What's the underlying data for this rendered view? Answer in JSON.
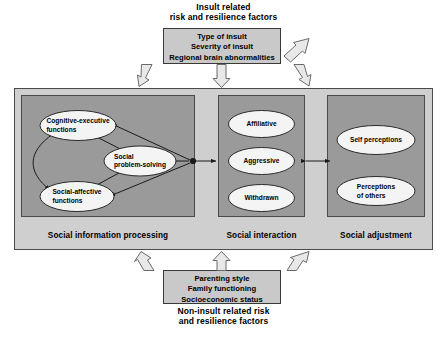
{
  "figure": {
    "top_caption": [
      "Insult related",
      "risk and resilience factors"
    ],
    "bottom_caption": [
      "Non-insult related risk",
      "and resilience factors"
    ]
  },
  "top_box": {
    "name": "insult-related-factors-box",
    "lines": [
      "Type of insult",
      "Severity of insult",
      "Regional brain abnormalities"
    ]
  },
  "bottom_box": {
    "name": "non-insult-related-factors-box",
    "lines": [
      "Parenting style",
      "Family functioning",
      "Socioeconomic status"
    ]
  },
  "panels": [
    {
      "id": "social-information-processing",
      "label": "Social information processing",
      "nodes": [
        {
          "id": "cognitive-executive-functions",
          "lines": [
            "Cognitive-executive",
            "functions"
          ]
        },
        {
          "id": "social-problem-solving",
          "lines": [
            "Social",
            "problem-solving"
          ]
        },
        {
          "id": "social-affective-functions",
          "lines": [
            "Social-affective",
            "functions"
          ]
        }
      ]
    },
    {
      "id": "social-interaction",
      "label": "Social interaction",
      "nodes": [
        {
          "id": "affiliative",
          "lines": [
            "Affiliative"
          ]
        },
        {
          "id": "aggressive",
          "lines": [
            "Aggressive"
          ]
        },
        {
          "id": "withdrawn",
          "lines": [
            "Withdrawn"
          ]
        }
      ]
    },
    {
      "id": "social-adjustment",
      "label": "Social adjustment",
      "nodes": [
        {
          "id": "self-perceptions",
          "lines": [
            "Self perceptions"
          ]
        },
        {
          "id": "perceptions-of-others",
          "lines": [
            "Perceptions",
            "of others"
          ]
        }
      ]
    }
  ],
  "colors": {
    "page_background": "#ffffff",
    "outer_container_fill": "#cfcfcf",
    "panel_fill": "#9a9a9a",
    "box_fill": "#c9c9c9",
    "ellipse_fill": "#f4f4f4",
    "stroke": "#333333",
    "text": "#000000"
  }
}
